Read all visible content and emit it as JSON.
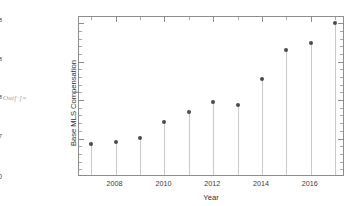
{
  "notebook": {
    "out_label": "Out[·]="
  },
  "chart_data": {
    "type": "scatter",
    "title": "",
    "xlabel": "Year",
    "ylabel": "Base MLS Compensation",
    "x": [
      2007,
      2008,
      2009,
      2010,
      2011,
      2012,
      2013,
      2014,
      2015,
      2016,
      2017
    ],
    "values": [
      42500000,
      46000000,
      51000000,
      71000000,
      84000000,
      98000000,
      94000000,
      127000000,
      165000000,
      174000000,
      200000000
    ],
    "xlim": [
      2006.5,
      2017.4
    ],
    "ylim": [
      0,
      208000000
    ],
    "xticks": [
      2008,
      2010,
      2012,
      2014,
      2016
    ],
    "xtick_labels": [
      "2008",
      "2010",
      "2012",
      "2014",
      "2016"
    ],
    "yticks": [
      0,
      50000000,
      100000000,
      150000000,
      200000000
    ],
    "ytick_labels": [
      {
        "mantissa": "0",
        "times": "",
        "base": "",
        "exp": ""
      },
      {
        "mantissa": "5.0",
        "times": "×",
        "base": "10",
        "exp": "7"
      },
      {
        "mantissa": "1.0",
        "times": "×",
        "base": "10",
        "exp": "8"
      },
      {
        "mantissa": "1.5",
        "times": "×",
        "base": "10",
        "exp": "8"
      },
      {
        "mantissa": "2.0",
        "times": "×",
        "base": "10",
        "exp": "8"
      }
    ],
    "grid": false,
    "legend": null,
    "marker_color": "#4a4a52",
    "stem_color": "#c9c9c9",
    "frame_color": "#8d8d8d",
    "style": "stem-plot"
  }
}
